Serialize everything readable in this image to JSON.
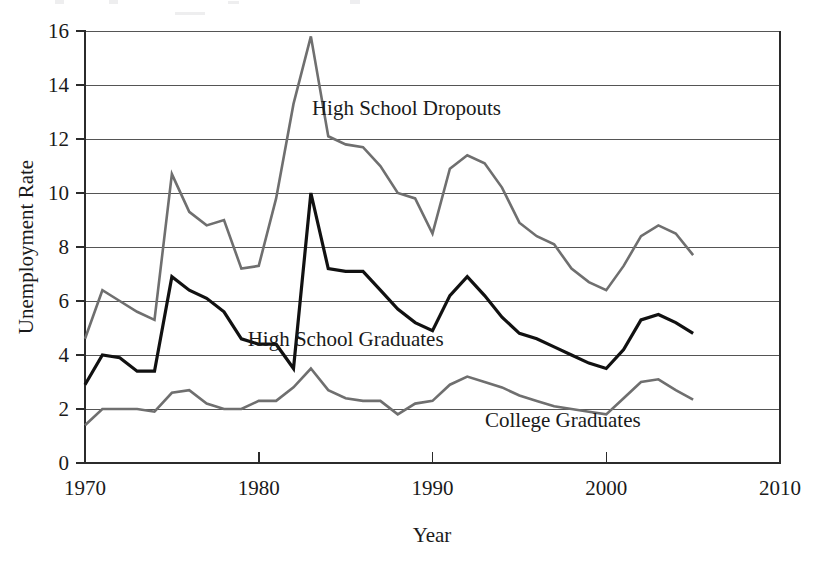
{
  "chart_data": {
    "type": "line",
    "title": "",
    "xlabel": "Year",
    "ylabel": "Unemployment Rate",
    "xlim": [
      1970,
      2010
    ],
    "ylim": [
      0,
      16
    ],
    "xticks": [
      1970,
      1980,
      1990,
      2000,
      2010
    ],
    "yticks": [
      0,
      2,
      4,
      6,
      8,
      10,
      12,
      14,
      16
    ],
    "grid": "horizontal",
    "legend": "inline-annotations",
    "x": [
      1970,
      1971,
      1972,
      1973,
      1974,
      1975,
      1976,
      1977,
      1978,
      1979,
      1980,
      1981,
      1982,
      1983,
      1984,
      1985,
      1986,
      1987,
      1988,
      1989,
      1990,
      1991,
      1992,
      1993,
      1994,
      1995,
      1996,
      1997,
      1998,
      1999,
      2000,
      2001,
      2002,
      2003,
      2004,
      2005
    ],
    "series": [
      {
        "name": "High School Dropouts",
        "color": "#6f6f6f",
        "width": 2.6,
        "label_x": 1988.5,
        "label_y": 12.9,
        "values": [
          4.6,
          6.4,
          6.0,
          5.6,
          5.3,
          10.7,
          9.3,
          8.8,
          9.0,
          7.2,
          7.3,
          9.8,
          13.3,
          15.8,
          12.1,
          11.8,
          11.7,
          11.0,
          10.0,
          9.8,
          8.5,
          10.9,
          11.4,
          11.1,
          10.2,
          8.9,
          8.4,
          8.1,
          7.2,
          6.7,
          6.4,
          7.3,
          8.4,
          8.8,
          8.5,
          7.7
        ]
      },
      {
        "name": "High School Graduates",
        "color": "#111111",
        "width": 3.2,
        "label_x": 1985.0,
        "label_y": 4.35,
        "values": [
          2.9,
          4.0,
          3.9,
          3.4,
          3.4,
          6.9,
          6.4,
          6.1,
          5.6,
          4.6,
          4.4,
          4.4,
          3.5,
          10.0,
          7.2,
          7.1,
          7.1,
          6.4,
          5.7,
          5.2,
          4.9,
          6.2,
          6.9,
          6.2,
          5.4,
          4.8,
          4.6,
          4.3,
          4.0,
          3.7,
          3.5,
          4.2,
          5.3,
          5.5,
          5.2,
          4.8
        ]
      },
      {
        "name": "College Graduates",
        "color": "#6f6f6f",
        "width": 2.6,
        "label_x": 1997.5,
        "label_y": 1.35,
        "values": [
          1.4,
          2.0,
          2.0,
          2.0,
          1.9,
          2.6,
          2.7,
          2.2,
          2.0,
          2.0,
          2.3,
          2.3,
          2.8,
          3.5,
          2.7,
          2.4,
          2.3,
          2.3,
          1.8,
          2.2,
          2.3,
          2.9,
          3.2,
          3.0,
          2.8,
          2.5,
          2.3,
          2.1,
          2.0,
          1.9,
          1.8,
          2.4,
          3.0,
          3.1,
          2.7,
          2.35
        ]
      }
    ]
  },
  "axes": {
    "y_title": "Unemployment Rate",
    "x_title": "Year",
    "y_tick_labels": [
      "0",
      "2",
      "4",
      "6",
      "8",
      "10",
      "12",
      "14",
      "16"
    ],
    "x_tick_labels": [
      "1970",
      "1980",
      "1990",
      "2000",
      "2010"
    ]
  },
  "annotations": [
    {
      "text": "High School Dropouts"
    },
    {
      "text": "High School Graduates"
    },
    {
      "text": "College Graduates"
    }
  ]
}
